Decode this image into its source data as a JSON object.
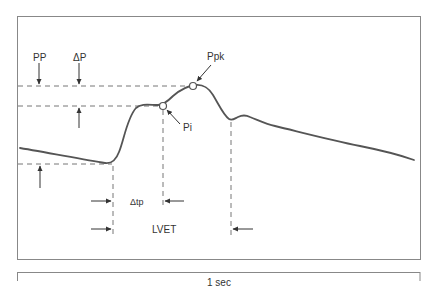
{
  "diagram": {
    "labels": {
      "pp": "PP",
      "delta_p": "ΔP",
      "ppk": "Ppk",
      "pi": "Pi",
      "delta_tp": "Δtp",
      "lvet": "LVET"
    },
    "scale_bar": {
      "label": "1 sec"
    },
    "colors": {
      "curve": "#555555",
      "frame": "#888888",
      "dashes": "#777777",
      "text": "#333333"
    }
  }
}
